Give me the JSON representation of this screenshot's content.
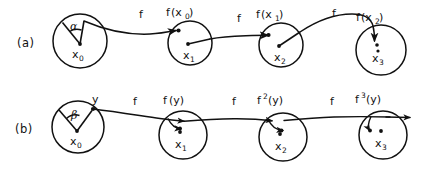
{
  "figure": {
    "title": "",
    "width": 424,
    "height": 170,
    "background": "#ffffff",
    "ink_color": "#111111"
  },
  "rows": [
    {
      "id": "row-a",
      "label": "(a)",
      "description": "Orbit of a point x0 under f with an angular sector alpha, mapped through successive circles",
      "angle_symbol": "α",
      "circles": [
        {
          "center_label": "x",
          "center_sub": "0",
          "cx": 80,
          "cy": 41,
          "r": 27
        },
        {
          "center_label": "x",
          "center_sub": "1",
          "cx": 190,
          "cy": 43,
          "r": 22
        },
        {
          "center_label": "x",
          "center_sub": "2",
          "cx": 281,
          "cy": 45,
          "r": 22
        },
        {
          "center_label": "x",
          "center_sub": "3",
          "cx": 381,
          "cy": 50,
          "r": 25
        }
      ],
      "map_labels": [
        {
          "text": "f",
          "x": 139,
          "y": 18
        },
        {
          "text": "f",
          "x": 237,
          "y": 22
        },
        {
          "text": "f",
          "x": 332,
          "y": 17
        }
      ],
      "image_labels": [
        {
          "base": "f",
          "arg": "(x",
          "sub": "0",
          "close": ")",
          "x": 168,
          "y": 15
        },
        {
          "base": "f",
          "arg": "(x",
          "sub": "1",
          "close": ")",
          "x": 258,
          "y": 17
        },
        {
          "base": "f",
          "arg": "(x",
          "sub": "2",
          "close": ")",
          "x": 358,
          "y": 20
        }
      ]
    },
    {
      "id": "row-b",
      "label": "(b)",
      "description": "Orbit of a point y under iterates of f with an angular sector beta, line passes through successive circles",
      "angle_symbol": "β",
      "point_label": "y",
      "circles": [
        {
          "center_label": "x",
          "center_sub": "0",
          "cx": 78,
          "cy": 127,
          "r": 26
        },
        {
          "center_label": "x",
          "center_sub": "1",
          "cx": 183,
          "cy": 135,
          "r": 24
        },
        {
          "center_label": "x",
          "center_sub": "2",
          "cx": 283,
          "cy": 137,
          "r": 24
        },
        {
          "center_label": "x",
          "center_sub": "3",
          "cx": 383,
          "cy": 135,
          "r": 24
        }
      ],
      "map_labels": [
        {
          "text": "f",
          "x": 133,
          "y": 105
        },
        {
          "text": "f",
          "x": 232,
          "y": 105
        },
        {
          "text": "f",
          "x": 330,
          "y": 105
        }
      ],
      "image_labels": [
        {
          "base": "f",
          "sup": "",
          "arg": "(y)",
          "x": 163,
          "y": 104
        },
        {
          "base": "f",
          "sup": "2",
          "arg": "(y)",
          "x": 258,
          "y": 104
        },
        {
          "base": "f",
          "sup": "3",
          "arg": "(y)",
          "x": 356,
          "y": 103
        }
      ]
    }
  ]
}
